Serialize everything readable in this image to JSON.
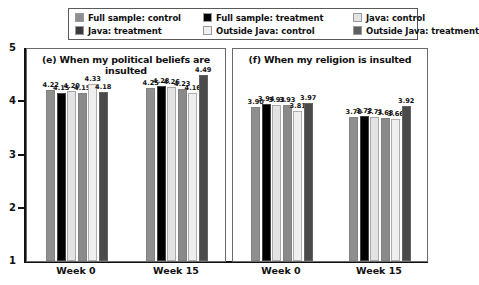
{
  "legend": {
    "items": [
      {
        "label": "Full sample: control",
        "color": "#8f8f8f",
        "name": "legend-full-sample-control"
      },
      {
        "label": "Full sample: treatment",
        "color": "#000000",
        "name": "legend-full-sample-treatment"
      },
      {
        "label": "Java: control",
        "color": "#e3e3e3",
        "name": "legend-java-control"
      },
      {
        "label": "Java: treatment",
        "color": "#3a3a3a",
        "name": "legend-java-treatment"
      },
      {
        "label": "Outside Java: control",
        "color": "#efefef",
        "name": "legend-outside-java-control"
      },
      {
        "label": "Outside Java: treatment",
        "color": "#5e5e5e",
        "name": "legend-outside-java-treatment"
      }
    ]
  },
  "axis": {
    "y_ticks": [
      "5",
      "4",
      "3",
      "2",
      "1"
    ],
    "x_categories": [
      "Week 0",
      "Week 15",
      "Week 0",
      "Week 15"
    ]
  },
  "chart_data": {
    "type": "bar",
    "title": "",
    "xlabel": "",
    "ylabel": "",
    "ylim": [
      1,
      5
    ],
    "grid": false,
    "legend_position": "top",
    "panels": [
      {
        "id": "e",
        "title": "(e) When my political beliefs are insulted",
        "categories": [
          "Week 0",
          "Week 15"
        ],
        "series": [
          {
            "name": "Full sample: control",
            "color": "#8f8f8f",
            "values": [
              4.22,
              4.25
            ]
          },
          {
            "name": "Full sample: treatment",
            "color": "#000000",
            "values": [
              4.15,
              4.28
            ]
          },
          {
            "name": "Java: control",
            "color": "#e3e3e3",
            "values": [
              4.2,
              4.26
            ]
          },
          {
            "name": "Java: treatment",
            "color": "#8a8a8a",
            "values": [
              4.15,
              4.23
            ]
          },
          {
            "name": "Outside Java: control",
            "color": "#efefef",
            "values": [
              4.33,
              4.16
            ]
          },
          {
            "name": "Outside Java: treatment",
            "color": "#4a4a4a",
            "values": [
              4.18,
              4.49
            ]
          }
        ]
      },
      {
        "id": "f",
        "title": "(f) When my religion is insulted",
        "categories": [
          "Week 0",
          "Week 15"
        ],
        "series": [
          {
            "name": "Full sample: control",
            "color": "#8f8f8f",
            "values": [
              3.9,
              3.7
            ]
          },
          {
            "name": "Full sample: treatment",
            "color": "#000000",
            "values": [
              3.94,
              3.72
            ]
          },
          {
            "name": "Java: control",
            "color": "#e3e3e3",
            "values": [
              3.93,
              3.71
            ]
          },
          {
            "name": "Java: treatment",
            "color": "#8a8a8a",
            "values": [
              3.93,
              3.68
            ]
          },
          {
            "name": "Outside Java: control",
            "color": "#efefef",
            "values": [
              3.81,
              3.66
            ]
          },
          {
            "name": "Outside Java: treatment",
            "color": "#4a4a4a",
            "values": [
              3.97,
              3.92
            ]
          }
        ]
      }
    ]
  }
}
